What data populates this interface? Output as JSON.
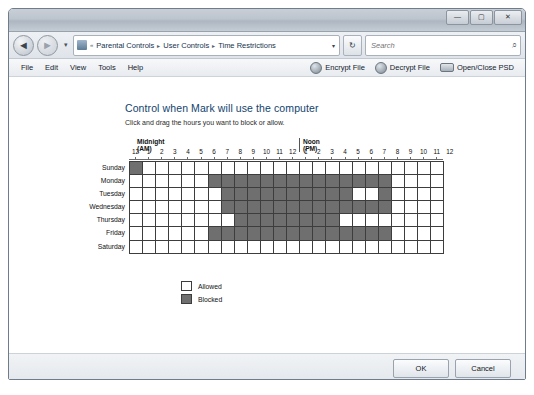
{
  "window": {
    "controls": {
      "minimize": "—",
      "maximize": "▢",
      "close": "✕"
    }
  },
  "addressbar": {
    "back_icon": "◄",
    "forward_icon": "►",
    "history_caret": "▾",
    "breadcrumb_sep": "«",
    "crumbs": [
      "Parental Controls",
      "User Controls",
      "Time Restrictions"
    ],
    "chevron": "▸",
    "dropdown_caret": "▾",
    "refresh_icon": "↻",
    "search_placeholder": "Search",
    "search_value": "",
    "search_icon": "⌕"
  },
  "menubar": {
    "items": [
      "File",
      "Edit",
      "View",
      "Tools",
      "Help"
    ],
    "toolbar": [
      {
        "label": "Encrypt File",
        "icon": "lock-icon"
      },
      {
        "label": "Decrypt File",
        "icon": "unlock-icon"
      },
      {
        "label": "Open/Close PSD",
        "icon": "drive-icon"
      }
    ]
  },
  "main": {
    "title": "Control when Mark will use the computer",
    "subtitle": "Click and drag the hours you want to block or allow.",
    "grid": {
      "am_header": "Midnight (AM)",
      "pm_header": "Noon (PM)",
      "hours": [
        "12",
        "1",
        "2",
        "3",
        "4",
        "5",
        "6",
        "7",
        "8",
        "9",
        "10",
        "11",
        "12",
        "1",
        "2",
        "3",
        "4",
        "5",
        "6",
        "7",
        "8",
        "9",
        "10",
        "11"
      ],
      "days": [
        "Sunday",
        "Monday",
        "Tuesday",
        "Wednesday",
        "Thursday",
        "Friday",
        "Saturday"
      ],
      "blocked": [
        [
          1,
          0,
          0,
          0,
          0,
          0,
          0,
          0,
          0,
          0,
          0,
          0,
          0,
          0,
          0,
          0,
          0,
          0,
          0,
          0,
          0,
          0,
          0,
          0
        ],
        [
          0,
          0,
          0,
          0,
          0,
          0,
          1,
          1,
          1,
          1,
          1,
          1,
          1,
          1,
          1,
          1,
          1,
          1,
          1,
          1,
          0,
          0,
          0,
          0
        ],
        [
          0,
          0,
          0,
          0,
          0,
          0,
          0,
          1,
          1,
          1,
          1,
          1,
          1,
          1,
          1,
          1,
          1,
          0,
          0,
          1,
          0,
          0,
          0,
          0
        ],
        [
          0,
          0,
          0,
          0,
          0,
          0,
          0,
          1,
          1,
          1,
          1,
          1,
          1,
          1,
          1,
          1,
          1,
          1,
          1,
          1,
          0,
          0,
          0,
          0
        ],
        [
          0,
          0,
          0,
          0,
          0,
          0,
          0,
          0,
          1,
          1,
          1,
          1,
          1,
          1,
          1,
          1,
          0,
          0,
          0,
          0,
          0,
          0,
          0,
          0
        ],
        [
          0,
          0,
          0,
          0,
          0,
          0,
          1,
          1,
          1,
          1,
          1,
          1,
          1,
          1,
          1,
          1,
          1,
          1,
          1,
          1,
          0,
          0,
          0,
          0
        ],
        [
          0,
          0,
          0,
          0,
          0,
          0,
          0,
          0,
          0,
          0,
          0,
          0,
          0,
          0,
          0,
          0,
          0,
          0,
          0,
          0,
          0,
          0,
          0,
          0
        ]
      ]
    },
    "legend": [
      {
        "label": "Allowed",
        "state": "allowed"
      },
      {
        "label": "Blocked",
        "state": "blocked"
      }
    ]
  },
  "footer": {
    "ok_label": "OK",
    "cancel_label": "Cancel"
  },
  "colors": {
    "blocked": "#6f6f6f",
    "allowed": "#ffffff",
    "grid_line": "#3d3d3d",
    "title_text": "#12436e"
  }
}
